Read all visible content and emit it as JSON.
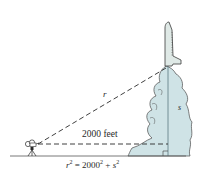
{
  "figure": {
    "labels": {
      "hypotenuse": "r",
      "height": "s",
      "distance": "2000 feet"
    },
    "equation": {
      "lhs_var": "r",
      "lhs_exp": "2",
      "equals": " = ",
      "base": "2000",
      "base_exp": "2",
      "plus": " + ",
      "rhs_var": "s",
      "rhs_exp": "2"
    },
    "colors": {
      "smoke": "#cfe3e6",
      "line": "#3a3a3a",
      "rocket": "#dfe9e6"
    }
  }
}
